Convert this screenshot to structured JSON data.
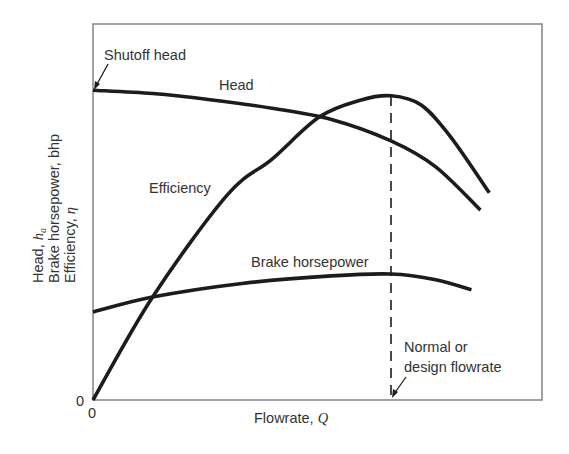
{
  "chart_data": {
    "type": "line",
    "title": "",
    "xlabel": "Flowrate, Q",
    "ylabel_lines": [
      "Head, h_a",
      "Brake horsepower, bhp",
      "Efficiency, η"
    ],
    "x_tick_labels": [
      "0"
    ],
    "y_tick_labels": [
      "0"
    ],
    "x_units": "relative flowrate (design flowrate = 1.0)",
    "y_units": "relative (0-100, top of frame = 100)",
    "xlim": [
      0,
      1.51
    ],
    "ylim": [
      0,
      100
    ],
    "grid": false,
    "legend": "none (curves labeled directly)",
    "series": [
      {
        "name": "Head",
        "x": [
          0.0,
          0.2,
          0.4,
          0.6,
          0.8,
          1.0,
          1.15,
          1.3
        ],
        "y": [
          82.4,
          81.5,
          79.8,
          77.6,
          74.6,
          68.9,
          62.0,
          50.5
        ]
      },
      {
        "name": "Efficiency",
        "x": [
          0.0,
          0.2,
          0.45,
          0.6,
          0.76,
          0.9,
          1.0,
          1.1,
          1.2,
          1.33
        ],
        "y": [
          0.0,
          27.4,
          54.5,
          64.0,
          75.3,
          79.8,
          80.9,
          78.5,
          70.0,
          55.1
        ]
      },
      {
        "name": "Brake horsepower",
        "x": [
          0.0,
          0.2,
          0.5,
          0.8,
          1.0,
          1.15,
          1.27
        ],
        "y": [
          23.4,
          27.4,
          31.0,
          33.0,
          33.5,
          32.0,
          29.3
        ]
      }
    ],
    "annotations": [
      {
        "text": "Shutoff head",
        "points_to": {
          "x": 0.0,
          "y": 82.4
        }
      },
      {
        "text": "Normal or design flowrate",
        "points_to": {
          "x": 1.0,
          "y": 0
        },
        "vertical_dashed_line_x": 1.0
      }
    ],
    "curve_labels": {
      "head": "Head",
      "efficiency": "Efficiency",
      "bhp": "Brake horsepower"
    }
  },
  "labels": {
    "shutoff": "Shutoff head",
    "head": "Head",
    "efficiency": "Efficiency",
    "bhp": "Brake horsepower",
    "design_line1": "Normal or",
    "design_line2": "design flowrate",
    "x_axis": "Flowrate, ",
    "x_axis_symbol": "Q",
    "y_line1": "Head, ",
    "y_line1_symbol": "h",
    "y_line1_sub": "a",
    "y_line2": "Brake horsepower, bhp",
    "y_line3": "Efficiency, ",
    "y_line3_symbol": "η",
    "x_zero": "0",
    "y_zero": "0"
  },
  "style": {
    "frame_color": "#8a8a8a",
    "curve_color": "#1c1c1c",
    "text_color": "#333333"
  }
}
